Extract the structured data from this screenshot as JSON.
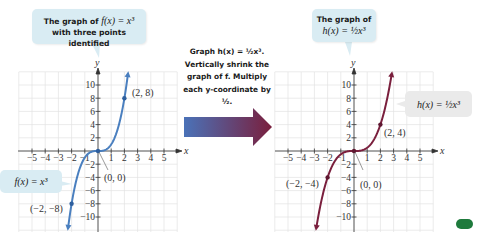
{
  "left_graph": {
    "callout_line1": "The graph of",
    "callout_func": "f(x) = x³",
    "callout_line2": "with three points identified",
    "function_label": "f(x) = x³",
    "axis_x_label": "x",
    "axis_y_label": "y",
    "curve_color": "#4a7fbf",
    "points": [
      {
        "label": "(2, 8)",
        "x": 2,
        "y": 8
      },
      {
        "label": "(0, 0)",
        "x": 0,
        "y": 0
      },
      {
        "label": "(−2, −8)",
        "x": -2,
        "y": -8
      }
    ]
  },
  "right_graph": {
    "callout_line1": "The graph of",
    "callout_func": "h(x) = ½x³",
    "function_label": "h(x) = ½x³",
    "axis_x_label": "x",
    "axis_y_label": "y",
    "curve_color": "#7a1f3d",
    "points": [
      {
        "label": "(2, 4)",
        "x": 2,
        "y": 4
      },
      {
        "label": "(0, 0)",
        "x": 0,
        "y": 0
      },
      {
        "label": "(−2, −4)",
        "x": -2,
        "y": -4
      }
    ]
  },
  "middle": {
    "line1": "Graph h(x) = ½x³.",
    "line2": "Vertically shrink the",
    "line3": "graph of f. Multiply",
    "line4": "each y-coordinate by ½.",
    "arrow_gradient_start": "#4a72b8",
    "arrow_gradient_end": "#7a1f3d"
  },
  "axes": {
    "x_ticks": [
      "−5",
      "−4",
      "−3",
      "−2",
      "−1",
      "1",
      "2",
      "3",
      "4",
      "5"
    ],
    "y_ticks": [
      "10",
      "8",
      "6",
      "4",
      "2",
      "−2",
      "−4",
      "−6",
      "−8",
      "−10"
    ]
  },
  "chart_data": [
    {
      "type": "line",
      "title": "The graph of f(x) = x³ with three points identified",
      "xlabel": "x",
      "ylabel": "y",
      "xlim": [
        -6,
        6
      ],
      "ylim": [
        -12,
        12
      ],
      "grid": true,
      "series": [
        {
          "name": "f(x) = x³",
          "function": "x^3"
        }
      ],
      "highlighted_points": [
        [
          2,
          8
        ],
        [
          0,
          0
        ],
        [
          -2,
          -8
        ]
      ]
    },
    {
      "type": "line",
      "title": "The graph of h(x) = ½x³",
      "xlabel": "x",
      "ylabel": "y",
      "xlim": [
        -6,
        6
      ],
      "ylim": [
        -12,
        12
      ],
      "grid": true,
      "series": [
        {
          "name": "h(x) = ½x³",
          "function": "0.5*x^3"
        }
      ],
      "highlighted_points": [
        [
          2,
          4
        ],
        [
          0,
          0
        ],
        [
          -2,
          -4
        ]
      ]
    }
  ]
}
